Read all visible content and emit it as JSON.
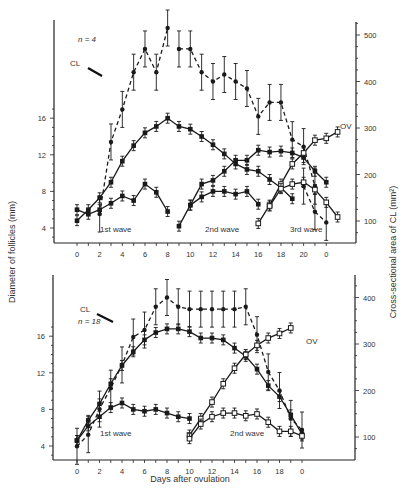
{
  "chart_data": [
    {
      "type": "line",
      "panel": "top",
      "annotation_n": "n = 4",
      "xlabel": "",
      "ylabel_left": "Diameter of follicles (mm)",
      "ylabel_right": "Cross-sectional area of CL (mm²)",
      "x_tick_labels": [
        "0",
        "2",
        "4",
        "6",
        "8",
        "10",
        "12",
        "14",
        "16",
        "18",
        "20",
        "0"
      ],
      "y_left_ticks": [
        4,
        8,
        12,
        16
      ],
      "y_right_ticks": [
        100,
        200,
        300,
        400,
        500
      ],
      "labels": {
        "cl": "CL",
        "ov": "OV",
        "wave1": "1st wave",
        "wave2": "2nd wave",
        "wave3": "3rd wave"
      },
      "series": [
        {
          "name": "CL area (right axis)",
          "axis": "right",
          "style": "dashed",
          "marker": "filled",
          "x": [
            0,
            1,
            2,
            3,
            4,
            5,
            6,
            7,
            8,
            9,
            10,
            11,
            12,
            13,
            14,
            15,
            16,
            17,
            18,
            19,
            20,
            21
          ],
          "values": [
            null,
            null,
            115,
            270,
            340,
            420,
            470,
            420,
            515,
            null,
            null,
            null,
            null,
            null,
            null,
            null,
            null,
            null,
            null,
            null,
            null,
            null
          ]
        },
        {
          "name": "CL area cont.",
          "axis": "right",
          "style": "dashed",
          "marker": "filled",
          "x": [
            9,
            10,
            11,
            12,
            13,
            14,
            15,
            16,
            17,
            18,
            19,
            20,
            21
          ],
          "values": [
            470,
            470,
            420,
            400,
            415,
            400,
            385,
            325,
            355,
            355,
            275,
            260,
            175
          ]
        },
        {
          "name": "CL area regression",
          "axis": "right",
          "style": "dashed",
          "marker": "filled",
          "x": [
            20,
            21,
            22
          ],
          "values": [
            175,
            120,
            97
          ]
        },
        {
          "name": "1st wave dominant",
          "axis": "left",
          "style": "solid",
          "marker": "filled",
          "x": [
            0,
            1,
            2,
            3,
            4,
            5,
            6,
            7,
            8,
            9,
            10,
            11,
            12,
            13,
            14,
            15,
            16,
            17,
            18,
            19
          ],
          "values": [
            4.8,
            6,
            7.3,
            9,
            11.3,
            13,
            14.4,
            15.1,
            16,
            15.1,
            14.8,
            14,
            13.1,
            12.1,
            11,
            10.4,
            10.2,
            9.3,
            8.4,
            7.2
          ]
        },
        {
          "name": "1st wave subordinate",
          "axis": "left",
          "style": "solid",
          "marker": "filled",
          "x": [
            0,
            1,
            2,
            3,
            4,
            5,
            6,
            7,
            8
          ],
          "values": [
            6,
            5.5,
            6,
            6.7,
            7.5,
            7,
            8.8,
            7.9,
            5.8
          ]
        },
        {
          "name": "2nd wave dominant",
          "axis": "left",
          "style": "solid",
          "marker": "filled",
          "x": [
            9,
            10,
            11,
            12,
            13,
            14,
            15,
            16,
            17,
            18,
            19,
            20,
            21,
            22
          ],
          "values": [
            4.2,
            6.5,
            8.8,
            9.2,
            10.2,
            11.4,
            11.4,
            12.5,
            12.3,
            12.4,
            12.2,
            11.7,
            10.2,
            9
          ]
        },
        {
          "name": "2nd wave subordinate",
          "axis": "left",
          "style": "solid",
          "marker": "filled",
          "x": [
            10,
            11,
            12,
            13,
            14,
            15,
            16
          ],
          "values": [
            6.5,
            7.4,
            8,
            8,
            7.7,
            8,
            6.6
          ]
        },
        {
          "name": "3rd wave dominant (OV)",
          "axis": "left",
          "style": "solid",
          "marker": "open",
          "x": [
            16,
            17,
            18,
            19,
            20,
            21,
            22,
            23
          ],
          "values": [
            4.5,
            6.5,
            8.8,
            11,
            12.2,
            13.6,
            13.8,
            14.5
          ]
        },
        {
          "name": "3rd wave subordinate",
          "axis": "left",
          "style": "solid",
          "marker": "open",
          "x": [
            17,
            18,
            19,
            20,
            21,
            22,
            23
          ],
          "values": [
            6.4,
            8.3,
            8.8,
            9,
            8.2,
            6.8,
            5.2
          ]
        }
      ]
    },
    {
      "type": "line",
      "panel": "bottom",
      "annotation_n": "n = 18",
      "xlabel": "Days after ovulation",
      "x_tick_labels": [
        "0",
        "2",
        "4",
        "6",
        "8",
        "10",
        "12",
        "14",
        "16",
        "18",
        "0"
      ],
      "y_left_ticks": [
        4,
        8,
        12,
        16
      ],
      "y_right_ticks": [
        100,
        200,
        300,
        400
      ],
      "labels": {
        "cl": "CL",
        "ov": "OV",
        "wave1": "1st wave",
        "wave2": "2nd wave"
      },
      "series": [
        {
          "name": "CL area (right axis)",
          "axis": "right",
          "style": "dashed",
          "marker": "filled",
          "x": [
            0,
            1,
            2,
            3,
            4,
            5,
            6,
            7,
            8,
            9,
            10,
            11,
            12,
            13,
            14,
            15,
            16,
            17,
            18,
            19,
            20
          ],
          "values": [
            80,
            105,
            160,
            205,
            255,
            315,
            330,
            380,
            400,
            380,
            375,
            375,
            375,
            375,
            375,
            380,
            320,
            240,
            200,
            140,
            115
          ]
        },
        {
          "name": "1st wave dominant",
          "axis": "left",
          "style": "solid",
          "marker": "filled",
          "x": [
            0,
            1,
            2,
            3,
            4,
            5,
            6,
            7,
            8,
            9,
            10,
            11,
            12,
            13,
            14,
            15,
            16,
            17,
            18,
            19,
            20
          ],
          "values": [
            4.6,
            6.8,
            8.6,
            10.8,
            12.8,
            14.3,
            15.6,
            16.4,
            16.8,
            16.8,
            16.5,
            15.8,
            15.8,
            15.6,
            14.7,
            13.8,
            12.4,
            10.6,
            9.4,
            7.4,
            5.3
          ]
        },
        {
          "name": "1st wave subordinate",
          "axis": "left",
          "style": "solid",
          "marker": "filled",
          "x": [
            0,
            1,
            2,
            3,
            4,
            5,
            6,
            7,
            8,
            9,
            10
          ],
          "values": [
            4.6,
            6.2,
            7.2,
            8.2,
            8.7,
            8,
            7.8,
            8,
            7.6,
            7.2,
            7
          ]
        },
        {
          "name": "2nd wave dominant (OV)",
          "axis": "left",
          "style": "solid",
          "marker": "open",
          "x": [
            10,
            11,
            12,
            13,
            14,
            15,
            16,
            17,
            18,
            19
          ],
          "values": [
            5.2,
            7,
            8.8,
            10.8,
            12.5,
            14,
            15,
            15.8,
            16.3,
            16.9
          ]
        },
        {
          "name": "2nd wave subordinate",
          "axis": "left",
          "style": "solid",
          "marker": "open",
          "x": [
            10,
            11,
            12,
            13,
            14,
            15,
            16,
            17,
            18,
            19,
            20
          ],
          "values": [
            4.8,
            6.4,
            7.2,
            7.6,
            7.6,
            7.3,
            7.5,
            6.6,
            5.6,
            5.6,
            5.1
          ]
        }
      ]
    }
  ]
}
